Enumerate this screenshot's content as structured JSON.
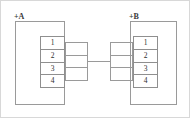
{
  "diagram": {
    "type": "electrical-wiring-schematic",
    "colors": {
      "line": "#9a9a9a",
      "strip_line": "#8f8f8f",
      "text": "#2e2e2e",
      "label_text": "#3a3a3a",
      "background": "#ffffff",
      "image_border": "#d8d8d8"
    },
    "cabinets": [
      {
        "id": "A",
        "label": "+A",
        "side": "left",
        "terminal_strip": {
          "name": "terminal-strip-a",
          "terminals": [
            "1",
            "2",
            "3",
            "4"
          ]
        }
      },
      {
        "id": "B",
        "label": "+B",
        "side": "right",
        "terminal_strip": {
          "name": "terminal-strip-b",
          "terminals": [
            "1",
            "2",
            "3",
            "4"
          ]
        }
      }
    ],
    "connectors": [
      {
        "id": "left-connector",
        "cells": 3,
        "attached_to": "+A"
      },
      {
        "id": "right-connector",
        "cells": 3,
        "attached_to": "+B"
      }
    ],
    "link": {
      "name": "interconnect-cable",
      "from": "left-connector",
      "to": "right-connector"
    }
  }
}
